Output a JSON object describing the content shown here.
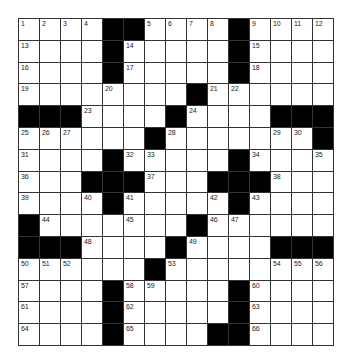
{
  "puzzle": {
    "rows": 15,
    "cols": 15,
    "colors": {
      "block": "#000000",
      "cell": "#ffffff",
      "line": "#333333"
    },
    "layout": [
      "1,2,3,4,#,#,5,6,7,8,#,9,10,11,12",
      "13,.,.,.,#,14,.,.,.,.,#,15,.,.,.",
      "16,.,.,.,#,17,.,.,.,.,#,18,.,.,.",
      "19,.,.,.,20,.,.,.,#,21,22,.,.,.,.",
      "#,#,#,23,.,.,.,#,24,.,.,.,#,#,#",
      "25,26,27,.,.,.,#,28,.,.,.,.,29,30,#",
      "31,.,.,.,#,32,33,.,.,.,#,34,.,.,35",
      "36,.,.,#,#,#,37,.,.,#,#,#,38,.,.",
      "39,.,.,40,#,41,.,.,.,42,#,43,.,.,.",
      "#,44,.,.,.,45,.,.,#,46,47,.,.,.,.",
      "#,#,#,48,.,.,.,#,49,.,.,.,#,#,#",
      "50,51,52,.,.,.,#,53,.,.,.,.,54,55,56",
      "57,.,.,.,#,58,59,.,.,.,#,60,.,.,.",
      "61,.,.,.,#,62,.,.,.,.,#,63,.,.,.",
      "64,.,.,.,#,65,.,.,.,#,#,66,.,.,."
    ]
  }
}
